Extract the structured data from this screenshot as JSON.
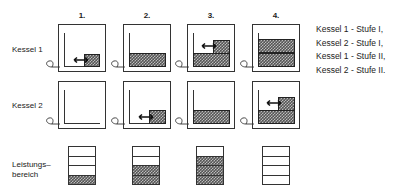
{
  "columns": [
    {
      "label": "1."
    },
    {
      "label": "2."
    },
    {
      "label": "3."
    },
    {
      "label": "4."
    }
  ],
  "rows": {
    "kessel1": {
      "label": "Kessel  1",
      "states": [
        {
          "fill": "low-partial",
          "arrow": true
        },
        {
          "fill": "half",
          "arrow": false
        },
        {
          "fill": "half-plus-partial",
          "arrow": true
        },
        {
          "fill": "full",
          "arrow": false
        }
      ]
    },
    "kessel2": {
      "label": "Kessel  2",
      "states": [
        {
          "fill": "empty",
          "arrow": false
        },
        {
          "fill": "low-partial",
          "arrow": true
        },
        {
          "fill": "half",
          "arrow": false
        },
        {
          "fill": "half-plus-partial",
          "arrow": true
        }
      ]
    },
    "leistung": {
      "label_line1": "Leistungs–",
      "label_line2": "bereich",
      "filled_segments": [
        1,
        2,
        3,
        4
      ],
      "total_segments": 4
    }
  },
  "legend": [
    "Kessel 1 - Stufe I,",
    "Kessel 2 - Stufe I,",
    "Kessel 1 - Stufe II,",
    "Kessel 2 - Stufe II."
  ],
  "colors": {
    "line": "#333333",
    "hatch_dark": "#555555",
    "hatch_light": "#bbbbbb"
  }
}
